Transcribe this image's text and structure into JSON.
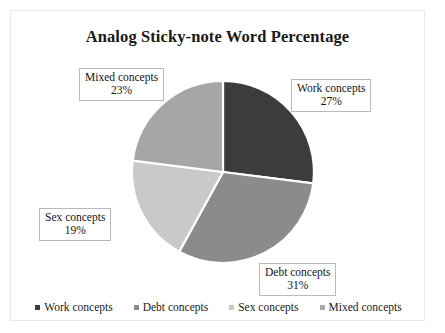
{
  "chart_data": {
    "type": "pie",
    "title": "Analog Sticky-note Word Percentage",
    "categories": [
      "Work concepts",
      "Debt concepts",
      "Sex concepts",
      "Mixed concepts"
    ],
    "values": [
      27,
      31,
      19,
      23
    ],
    "value_suffix": "%",
    "colors": [
      "#3c3c3c",
      "#8b8b8b",
      "#c9c9c9",
      "#a6a6a6"
    ],
    "start_angle_deg": 0,
    "direction": "clockwise",
    "legend_position": "bottom",
    "grid": false,
    "labels": [
      {
        "key": "work",
        "name": "Work concepts",
        "percent": "27%"
      },
      {
        "key": "debt",
        "name": "Debt concepts",
        "percent": "31%"
      },
      {
        "key": "sex",
        "name": "Sex concepts",
        "percent": "19%"
      },
      {
        "key": "mixed",
        "name": "Mixed concepts",
        "percent": "23%"
      }
    ],
    "legend": [
      {
        "label": "Work concepts",
        "color": "#3c3c3c"
      },
      {
        "label": "Debt concepts",
        "color": "#8b8b8b"
      },
      {
        "label": "Sex concepts",
        "color": "#c9c9c9"
      },
      {
        "label": "Mixed concepts",
        "color": "#a6a6a6"
      }
    ]
  },
  "frame": {
    "border_color": "#e8e8e8",
    "background": "#ffffff"
  }
}
